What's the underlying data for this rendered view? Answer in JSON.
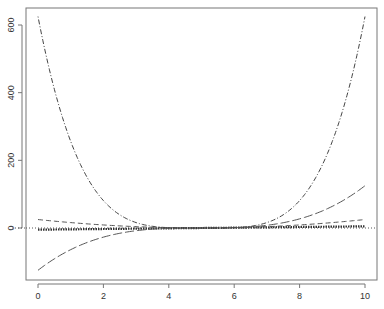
{
  "chart_data": {
    "type": "line",
    "title": "",
    "xlabel": "",
    "ylabel": "",
    "xlim": [
      0,
      10
    ],
    "ylim": [
      -125,
      625
    ],
    "grid": false,
    "legend": null,
    "x_ticks": [
      "0",
      "2",
      "4",
      "6",
      "8",
      "10"
    ],
    "y_ticks": [
      "0",
      "200",
      "400",
      "600"
    ],
    "reference_line": {
      "y": 0,
      "style": "dotted"
    },
    "series": [
      {
        "name": "(x-5)^1",
        "style": "dotted-thick",
        "x": [
          0,
          1,
          2,
          3,
          4,
          5,
          6,
          7,
          8,
          9,
          10
        ],
        "values": [
          -5,
          -4,
          -3,
          -2,
          -1,
          0,
          1,
          2,
          3,
          4,
          5
        ]
      },
      {
        "name": "(x-5)^2",
        "style": "dashed",
        "x": [
          0,
          1,
          2,
          3,
          4,
          5,
          6,
          7,
          8,
          9,
          10
        ],
        "values": [
          25,
          16,
          9,
          4,
          1,
          0,
          1,
          4,
          9,
          16,
          25
        ]
      },
      {
        "name": "(x-5)^3",
        "style": "longdash",
        "x": [
          0,
          1,
          2,
          3,
          4,
          5,
          6,
          7,
          8,
          9,
          10
        ],
        "values": [
          -125,
          -64,
          -27,
          -8,
          -1,
          0,
          1,
          8,
          27,
          64,
          125
        ]
      },
      {
        "name": "(x-5)^4",
        "style": "dotdash",
        "x": [
          0,
          1,
          2,
          3,
          4,
          5,
          6,
          7,
          8,
          9,
          10
        ],
        "values": [
          625,
          256,
          81,
          16,
          1,
          0,
          1,
          16,
          81,
          256,
          625
        ]
      }
    ]
  },
  "axes": {
    "x_tick_labels": [
      "0",
      "2",
      "4",
      "6",
      "8",
      "10"
    ],
    "y_tick_labels": [
      "0",
      "200",
      "400",
      "600"
    ]
  }
}
